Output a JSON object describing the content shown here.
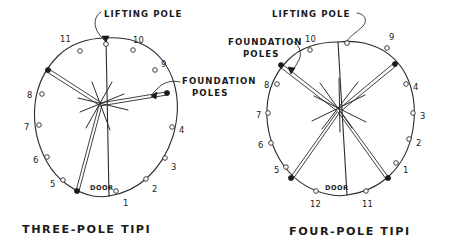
{
  "figure": {
    "background_color": "#ffffff",
    "ink_color": "#2b2b2b",
    "style": "hand-drawn pen-and-ink technical illustration"
  },
  "left_diagram": {
    "caption": "THREE-POLE TIPI",
    "door_label": "DOOR",
    "callouts": [
      {
        "id": "lifting-pole",
        "text": "LIFTING POLE"
      },
      {
        "id": "foundation-poles",
        "line1": "FOUNDATION",
        "line2": "POLES"
      }
    ],
    "peg_numbers": [
      "1",
      "2",
      "3",
      "4",
      "5",
      "6",
      "7",
      "8",
      "9",
      "10",
      "11"
    ],
    "foundation_pole_count": 3,
    "lifting_pole_position": "12",
    "total_pegs": 11
  },
  "right_diagram": {
    "caption": "FOUR-POLE TIPI",
    "door_label": "DOOR",
    "callouts": [
      {
        "id": "lifting-pole",
        "text": "LIFTING POLE"
      },
      {
        "id": "foundation-poles",
        "line1": "FOUNDATION",
        "line2": "POLES"
      }
    ],
    "peg_numbers": [
      "1",
      "2",
      "3",
      "4",
      "5",
      "6",
      "7",
      "8",
      "9",
      "10",
      "11",
      "12"
    ],
    "foundation_pole_count": 4,
    "lifting_pole_position": "10",
    "total_pegs": 12
  }
}
